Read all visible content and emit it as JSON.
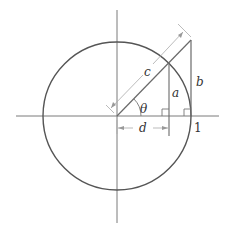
{
  "diagram": {
    "type": "unit-circle-trig",
    "labels": {
      "hypotenuse": "c",
      "opposite_inner": "a",
      "tangent_segment": "b",
      "adjacent": "d",
      "angle": "θ",
      "unit_mark": "1"
    },
    "colors": {
      "circle": "#555555",
      "axes": "#7a7a7a",
      "lines": "#6a6a6a",
      "dimension": "#aaaaaa",
      "text": "#333333"
    }
  }
}
